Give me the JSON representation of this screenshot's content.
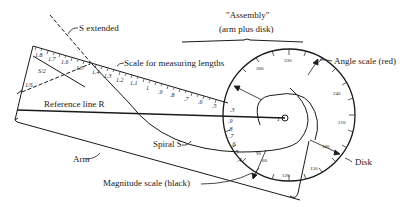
{
  "diagram": {
    "labels": {
      "s_extended": "S extended",
      "assembly_line1": "\"Assembly\"",
      "assembly_line2": "(arm plus disk)",
      "scale_for_lengths": "Scale for measuring lengths",
      "angle_scale": "Angle scale (red)",
      "reference_line": "Reference line R",
      "spiral_s": "Spiral S",
      "arm": "Arm",
      "disk": "Disk",
      "magnitude_scale": "Magnitude scale (black)",
      "s_over_2": "S/2",
      "one_over_s": "1/S"
    },
    "length_scale_ticks": [
      "1.8",
      "1.7",
      "1.6",
      "1.5",
      "1.4",
      "1.3",
      "1.2",
      "1.1",
      "1",
      ".9",
      ".8",
      ".7",
      ".6",
      ".5",
      ".4",
      ".3",
      ".2",
      ".1"
    ],
    "angle_scale_ticks": [
      "330",
      "300",
      "270",
      "240",
      "210",
      "180",
      "150",
      "120",
      "90",
      "60",
      "30"
    ],
    "magnitude_scale_ticks": [
      "1",
      ".9",
      ".8",
      ".7",
      ".6",
      ".5",
      ".4",
      ".3",
      ".2",
      ".1"
    ],
    "colors": {
      "ink": "#1a1a1a",
      "background": "#ffffff"
    }
  }
}
